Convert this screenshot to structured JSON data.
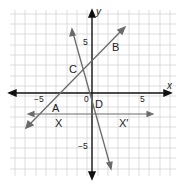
{
  "diagram": {
    "type": "coordinate-plane",
    "axes": {
      "x_label": "x",
      "y_label": "y",
      "origin_label": "0",
      "x_ticks": [
        {
          "value": -5,
          "label": "−5"
        },
        {
          "value": 5,
          "label": "5"
        }
      ],
      "y_ticks": [
        {
          "value": 5,
          "label": "5"
        },
        {
          "value": -5,
          "label": "−5"
        }
      ],
      "range": {
        "x": [
          -8,
          8
        ],
        "y": [
          -8,
          8
        ]
      }
    },
    "lines": [
      {
        "name": "AB",
        "description": "line through A and B",
        "slope": 1,
        "y_intercept": 3
      },
      {
        "name": "CD",
        "description": "steep line through C and D",
        "slope": -3.5,
        "y_intercept": -0.5
      },
      {
        "name": "XX'",
        "description": "horizontal line",
        "y": -2
      }
    ],
    "points": [
      {
        "label": "A",
        "x": -4,
        "y": -1
      },
      {
        "label": "B",
        "x": 4,
        "y": 7
      },
      {
        "label": "C",
        "x": -1,
        "y": 2
      },
      {
        "label": "D",
        "x": 0,
        "y": -1
      },
      {
        "label": "X",
        "x": -3,
        "y": -2
      },
      {
        "label": "X′",
        "x": 3,
        "y": -2
      }
    ],
    "colors": {
      "grid": "#c8c8c8",
      "axis": "#111111",
      "line": "#6a6a6a"
    }
  }
}
